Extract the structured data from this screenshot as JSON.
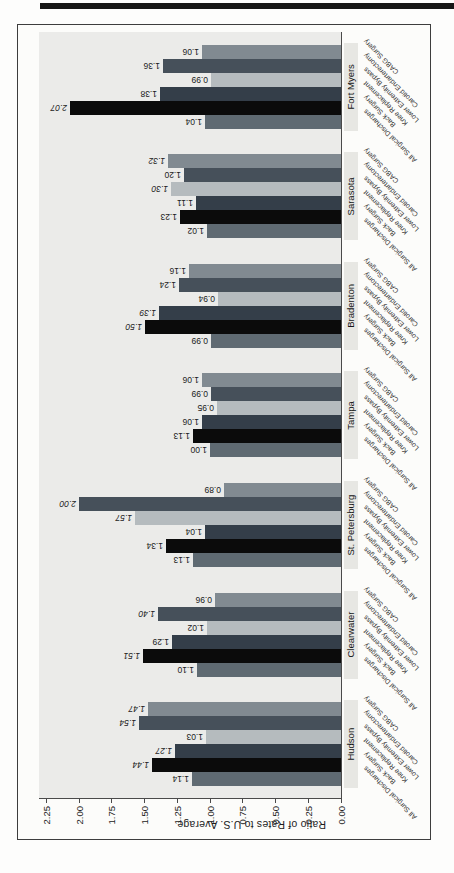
{
  "page": {
    "accent_colors": {
      "rule": "#161616",
      "plot_background": "#ebebe9",
      "city_band": "#e7e7e3"
    }
  },
  "chart_data": {
    "type": "bar",
    "title": "",
    "ylabel": "Ratio of Rates to U.S. Average",
    "xlabel": "",
    "ylim": [
      0,
      2.25
    ],
    "ytick_step": 0.25,
    "yticks": [
      "0.00",
      "0.25",
      "0.50",
      "0.75",
      "1.00",
      "1.25",
      "1.50",
      "1.75",
      "2.00",
      "2.25"
    ],
    "grid": false,
    "legend_position": "none",
    "orientation": "vertical bars, figure rotated 90deg CCW on page",
    "categories": [
      "Hudson",
      "Clearwater",
      "St. Petersburg",
      "Tampa",
      "Bradenton",
      "Sarasota",
      "Fort Myers"
    ],
    "series": [
      {
        "name": "All Surgical Discharges",
        "color": "#5f6a72",
        "values": [
          1.14,
          1.1,
          1.13,
          1.0,
          0.99,
          1.02,
          1.04
        ],
        "italic": [
          false,
          false,
          false,
          false,
          false,
          false,
          false
        ]
      },
      {
        "name": "Back Surgery",
        "color": "#0b0b0b",
        "values": [
          1.44,
          1.51,
          1.34,
          1.13,
          1.5,
          1.23,
          2.07
        ],
        "italic": [
          true,
          true,
          false,
          false,
          true,
          false,
          true
        ]
      },
      {
        "name": "Knee Replacement",
        "color": "#343e49",
        "values": [
          1.27,
          1.29,
          1.04,
          1.06,
          1.39,
          1.11,
          1.38
        ],
        "italic": [
          true,
          false,
          false,
          false,
          true,
          false,
          false
        ]
      },
      {
        "name": "Lower Extremity Bypass",
        "color": "#b5bbbe",
        "values": [
          1.03,
          1.02,
          1.57,
          0.95,
          0.94,
          1.3,
          0.99
        ],
        "italic": [
          false,
          false,
          true,
          false,
          false,
          true,
          false
        ]
      },
      {
        "name": "Carotid Endarterectomy",
        "color": "#46505a",
        "values": [
          1.54,
          1.4,
          2.0,
          0.99,
          1.24,
          1.2,
          1.36
        ],
        "italic": [
          true,
          true,
          true,
          false,
          false,
          false,
          false
        ]
      },
      {
        "name": "CABG Surgery",
        "color": "#818a91",
        "values": [
          1.47,
          0.96,
          0.89,
          1.06,
          1.16,
          1.32,
          1.06
        ],
        "italic": [
          true,
          false,
          false,
          false,
          false,
          true,
          false
        ]
      }
    ]
  }
}
